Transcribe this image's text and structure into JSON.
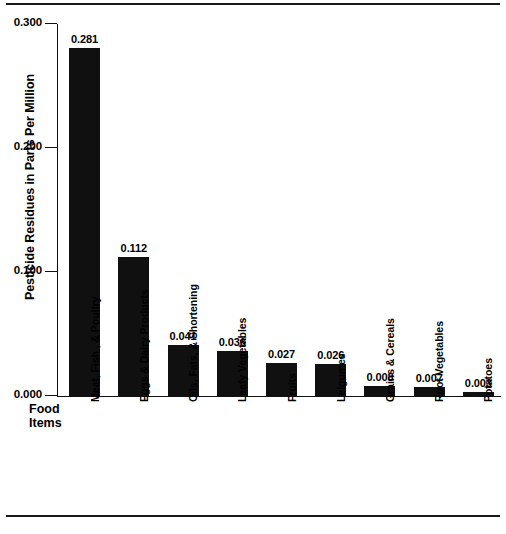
{
  "chart_data": {
    "type": "bar",
    "title": "",
    "xlabel": "Food Items",
    "ylabel": "Pesticide Residues in Parts Per Million",
    "categories": [
      "Meat, Fish , & Poultry",
      "Eggs & Dairy Products",
      "Oils, Fats, & Shortening",
      "Leafy Vegetables",
      "Fruits",
      "Lelgumes",
      "Grains & Cereals",
      "Root Vegetables",
      "Potatoes"
    ],
    "values": [
      0.281,
      0.112,
      0.041,
      0.036,
      0.027,
      0.026,
      0.008,
      0.007,
      0.003
    ],
    "value_labels": [
      "0.281",
      "0.112",
      "0.041",
      "0.036",
      "0.027",
      "0.026",
      "0.008",
      "0.007",
      "0.003"
    ],
    "ylim": [
      0.0,
      0.3
    ],
    "ytick_values": [
      0.0,
      0.1,
      0.2,
      0.3
    ],
    "ytick_labels": [
      "0.000",
      "0.100",
      "0.200",
      "0.300"
    ],
    "grid": false,
    "legend": null,
    "bar_color": "#101010",
    "background_color": "#ffffff",
    "axis_color": "#111111"
  }
}
